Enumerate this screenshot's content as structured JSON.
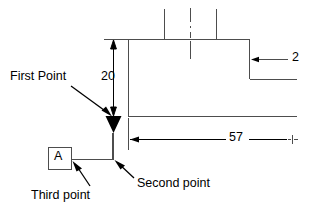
{
  "drawing": {
    "type": "engineering-dimension-sketch",
    "background_color": "#ffffff",
    "line_color": "#4d4d4d",
    "marker_color": "#000000",
    "text_color": "#000000",
    "dimensions": [
      {
        "id": "vertical-20",
        "value": "20",
        "orientation": "vertical",
        "arrows": "both-ends"
      },
      {
        "id": "horizontal-57",
        "value": "57",
        "orientation": "horizontal",
        "arrows": "left-end"
      },
      {
        "id": "horizontal-2",
        "value": "2",
        "orientation": "horizontal",
        "arrows": "left-end"
      }
    ],
    "datum": {
      "letter": "A",
      "shape": "square-box"
    },
    "callouts": [
      {
        "id": "first-point",
        "text": "First Point",
        "leader": "diagonal-down-right"
      },
      {
        "id": "second-point",
        "text": "Second point",
        "leader": "diagonal-up-left"
      },
      {
        "id": "third-point",
        "text": "Third point",
        "leader": "diagonal-up-right"
      }
    ],
    "markers": [
      {
        "id": "first-point-marker",
        "shape": "filled-down-triangle"
      }
    ],
    "centerlines": 1,
    "hatch_ticks": 3
  },
  "labels": {
    "first_point": "First Point",
    "second_point": "Second point",
    "third_point": "Third point",
    "datum_a": "A"
  },
  "values": {
    "dim_20": "20",
    "dim_57": "57",
    "dim_2": "2"
  }
}
